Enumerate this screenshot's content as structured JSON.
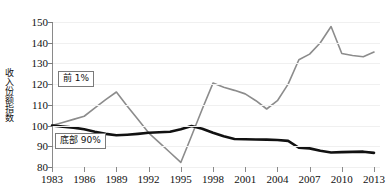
{
  "chart_data": {
    "type": "line",
    "title": "",
    "xlabel": "",
    "ylabel": "收入份额指数",
    "xlim": [
      1983,
      2013
    ],
    "ylim": [
      80,
      150
    ],
    "yticks": [
      80,
      90,
      100,
      110,
      120,
      130,
      140,
      150
    ],
    "xticks": [
      1983,
      1986,
      1989,
      1992,
      1995,
      1998,
      2001,
      2004,
      2007,
      2010,
      2013
    ],
    "grid": true,
    "legend_position": "inline-callout",
    "x": [
      1983,
      1984,
      1985,
      1986,
      1987,
      1988,
      1989,
      1990,
      1991,
      1992,
      1993,
      1994,
      1995,
      1996,
      1997,
      1998,
      1999,
      2000,
      2001,
      2002,
      2003,
      2004,
      2005,
      2006,
      2007,
      2008,
      2009,
      2010,
      2011,
      2012,
      2013
    ],
    "series": [
      {
        "name": "前 1%",
        "color": "#8c8c8c",
        "width": 1.6,
        "values": [
          100.0,
          101.5,
          103.0,
          104.5,
          108.5,
          112.5,
          116.2,
          109.5,
          103.0,
          96.5,
          91.8,
          87.0,
          82.2,
          95.0,
          108.0,
          120.5,
          118.5,
          117.0,
          115.3,
          112.0,
          108.0,
          112.0,
          120.0,
          131.8,
          134.5,
          140.0,
          147.8,
          134.8,
          133.8,
          133.2,
          135.5
        ]
      },
      {
        "name": "底部 90%",
        "color": "#111111",
        "width": 2.6,
        "values": [
          100.0,
          99.5,
          99.0,
          98.2,
          97.0,
          96.0,
          95.3,
          95.6,
          96.0,
          96.5,
          96.8,
          97.0,
          98.2,
          99.8,
          98.5,
          96.5,
          94.8,
          93.5,
          93.4,
          93.3,
          93.2,
          93.0,
          92.6,
          89.3,
          89.0,
          87.8,
          87.0,
          87.2,
          87.3,
          87.4,
          86.8
        ]
      }
    ]
  },
  "axis": {
    "y_title": "收入份额指数"
  },
  "legend": {
    "top1_label": "前 1%",
    "bottom90_label": "底部 90%"
  }
}
